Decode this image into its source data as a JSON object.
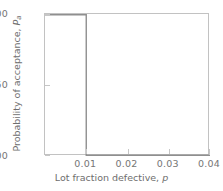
{
  "chart_data": {
    "type": "line",
    "title": "",
    "subtitle": "",
    "xlabel_text": "Lot fraction defective, ",
    "xlabel_symbol": "p",
    "ylabel_text": "Probability of acceptance, ",
    "ylabel_symbol": "P",
    "ylabel_subscript": "a",
    "xlim": [
      0,
      0.04
    ],
    "ylim": [
      0,
      1
    ],
    "grid": false,
    "legend": "none",
    "xticks": [
      0.01,
      0.02,
      0.03,
      0.04
    ],
    "xtick_labels": [
      "0.01",
      "0.02",
      "0.03",
      "0.04"
    ],
    "yticks": [
      0,
      0.5,
      1
    ],
    "ytick_labels": [
      "0.00",
      "0.50",
      "1.00"
    ],
    "series": [
      {
        "name": "Ideal OC curve",
        "x": [
          0,
          0.01,
          0.01,
          0.04
        ],
        "values": [
          1.0,
          1.0,
          0.0,
          0.0
        ],
        "color": "#8f8f8f",
        "linewidth": 1.4,
        "description": "Step function: acceptance probability 1.00 for p below 0.01, dropping to 0.00 at p = 0.01"
      }
    ],
    "annotations": [],
    "axis_color": "#c2c2c2",
    "tick_color": "#c6c6c6",
    "text_color": "#6e6e6e",
    "background": "#ffffff"
  }
}
